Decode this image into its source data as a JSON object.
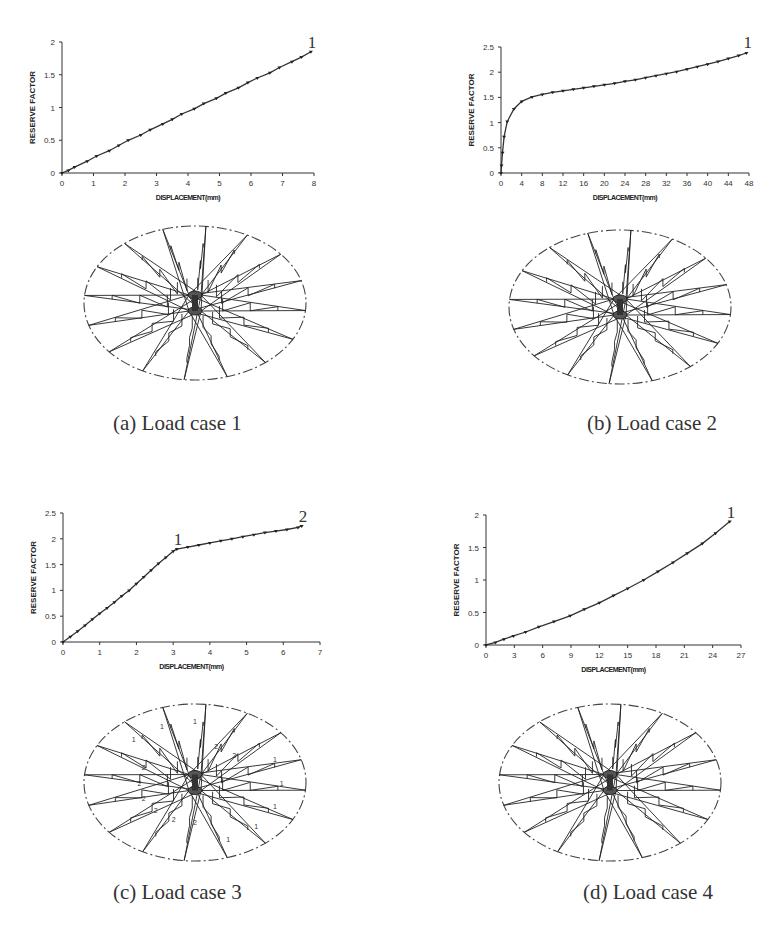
{
  "chart_data": [
    {
      "id": "a",
      "type": "line",
      "title": "(a) Load case 1",
      "xlabel": "DISPLACEMENT(mm)",
      "ylabel": "RESERVE FACTOR",
      "xlim": [
        0,
        8
      ],
      "ylim": [
        0,
        2
      ],
      "xticks": [
        0,
        1,
        2,
        3,
        4,
        5,
        6,
        7,
        8
      ],
      "yticks": [
        0,
        0.5,
        1,
        1.5,
        2
      ],
      "grid": false,
      "annotations": [
        {
          "text": "1",
          "x": 7.9,
          "y": 1.85
        }
      ],
      "series": [
        {
          "name": "Load case 1",
          "marker": "triangle-down",
          "x": [
            0,
            0.2,
            0.4,
            0.8,
            1.1,
            1.5,
            1.8,
            2.1,
            2.5,
            2.8,
            3.2,
            3.5,
            3.8,
            4.2,
            4.5,
            4.9,
            5.2,
            5.6,
            5.9,
            6.2,
            6.6,
            6.9,
            7.3,
            7.6,
            7.9
          ],
          "y": [
            0,
            0.04,
            0.09,
            0.18,
            0.26,
            0.34,
            0.42,
            0.5,
            0.58,
            0.66,
            0.75,
            0.82,
            0.9,
            0.98,
            1.06,
            1.14,
            1.22,
            1.3,
            1.38,
            1.45,
            1.53,
            1.61,
            1.7,
            1.77,
            1.85
          ]
        }
      ]
    },
    {
      "id": "b",
      "type": "line",
      "title": "(b) Load case 2",
      "xlabel": "DISPLACEMENT(mm)",
      "ylabel": "RESERVE FACTOR",
      "xlim": [
        0,
        48
      ],
      "ylim": [
        0,
        2.5
      ],
      "xticks": [
        0,
        4,
        8,
        12,
        16,
        20,
        24,
        28,
        32,
        36,
        40,
        44,
        48
      ],
      "yticks": [
        0,
        0.5,
        1,
        1.5,
        2,
        2.5
      ],
      "grid": false,
      "annotations": [
        {
          "text": "1",
          "x": 47.5,
          "y": 2.4
        }
      ],
      "series": [
        {
          "name": "Load case 2",
          "marker": "triangle-down",
          "x": [
            0,
            0.1,
            0.3,
            0.6,
            1.2,
            2.5,
            4,
            6,
            8,
            10,
            12,
            14,
            16,
            18,
            20,
            22,
            24,
            26,
            28,
            30,
            32,
            34,
            36,
            38,
            40,
            42,
            44,
            46,
            47.5
          ],
          "y": [
            0,
            0.15,
            0.4,
            0.72,
            1.02,
            1.27,
            1.42,
            1.51,
            1.56,
            1.6,
            1.63,
            1.66,
            1.69,
            1.72,
            1.75,
            1.78,
            1.82,
            1.85,
            1.89,
            1.93,
            1.97,
            2.01,
            2.06,
            2.11,
            2.16,
            2.21,
            2.27,
            2.33,
            2.38
          ]
        }
      ]
    },
    {
      "id": "c",
      "type": "line",
      "title": "(c) Load case 3",
      "xlabel": "DISPLACEMENT(mm)",
      "ylabel": "RESERVE FACTOR",
      "xlim": [
        0,
        7
      ],
      "ylim": [
        0,
        2.5
      ],
      "xticks": [
        0,
        1,
        2,
        3,
        4,
        5,
        6,
        7
      ],
      "yticks": [
        0,
        0.5,
        1,
        1.5,
        2,
        2.5
      ],
      "grid": false,
      "annotations": [
        {
          "text": "1",
          "x": 3.1,
          "y": 1.8
        },
        {
          "text": "2",
          "x": 6.5,
          "y": 2.25
        }
      ],
      "series": [
        {
          "name": "Load case 3",
          "marker": "triangle-down",
          "x": [
            0,
            0.2,
            0.4,
            0.6,
            0.8,
            1.0,
            1.2,
            1.4,
            1.6,
            1.8,
            2.0,
            2.2,
            2.4,
            2.6,
            2.8,
            3.0,
            3.1,
            3.4,
            3.7,
            4.0,
            4.3,
            4.6,
            4.9,
            5.2,
            5.5,
            5.8,
            6.1,
            6.4,
            6.5
          ],
          "y": [
            0,
            0.1,
            0.21,
            0.32,
            0.44,
            0.55,
            0.66,
            0.77,
            0.89,
            1.0,
            1.13,
            1.26,
            1.39,
            1.52,
            1.64,
            1.76,
            1.8,
            1.84,
            1.88,
            1.92,
            1.96,
            2.0,
            2.04,
            2.08,
            2.12,
            2.15,
            2.18,
            2.22,
            2.25
          ]
        }
      ]
    },
    {
      "id": "d",
      "type": "line",
      "title": "(d) Load case 4",
      "xlabel": "DISPLACEMENT(mm)",
      "ylabel": "RESERVE FACTOR",
      "xlim": [
        0,
        27
      ],
      "ylim": [
        0,
        2
      ],
      "xticks": [
        0,
        3,
        6,
        9,
        12,
        15,
        18,
        21,
        24,
        27
      ],
      "yticks": [
        0,
        0.5,
        1,
        1.5,
        2
      ],
      "grid": false,
      "annotations": [
        {
          "text": "1",
          "x": 25.8,
          "y": 1.9
        }
      ],
      "series": [
        {
          "name": "Load case 4",
          "marker": "triangle-down",
          "x": [
            0,
            1,
            1.9,
            2.9,
            4.2,
            5.6,
            7.2,
            8.9,
            10.4,
            12,
            13.5,
            15,
            16.7,
            18.2,
            19.8,
            21.3,
            22.9,
            24.3,
            25.8
          ],
          "y": [
            0,
            0.04,
            0.09,
            0.14,
            0.2,
            0.28,
            0.36,
            0.45,
            0.55,
            0.65,
            0.76,
            0.87,
            1.0,
            1.13,
            1.27,
            1.41,
            1.56,
            1.72,
            1.9
          ]
        }
      ]
    }
  ],
  "captions": {
    "a": "(a) Load case 1",
    "b": "(b) Load case 2",
    "c": "(c) Load case 3",
    "d": "(d) Load case 4"
  },
  "diagram_labels": {
    "c": [
      "1",
      "1",
      "1",
      "1",
      "2",
      "2",
      "2",
      "2",
      "2",
      "2",
      "1",
      "1",
      "1",
      "2",
      "2",
      "1"
    ]
  }
}
